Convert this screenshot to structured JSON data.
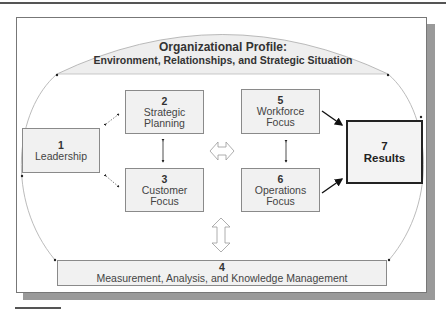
{
  "diagram": {
    "profile": {
      "title": "Organizational Profile:",
      "subtitle": "Environment, Relationships, and Strategic Situation"
    },
    "boxes": [
      {
        "id": "leadership",
        "number": "1",
        "label": "Leadership"
      },
      {
        "id": "strategic-planning",
        "number": "2",
        "label_lines": [
          "Strategic",
          "Planning"
        ]
      },
      {
        "id": "customer-focus",
        "number": "3",
        "label_lines": [
          "Customer",
          "Focus"
        ]
      },
      {
        "id": "measurement",
        "number": "4",
        "label": "Measurement, Analysis, and Knowledge Management"
      },
      {
        "id": "workforce-focus",
        "number": "5",
        "label_lines": [
          "Workforce",
          "Focus"
        ]
      },
      {
        "id": "operations-focus",
        "number": "6",
        "label_lines": [
          "Operations",
          "Focus"
        ]
      },
      {
        "id": "results",
        "number": "7",
        "label": "Results"
      }
    ],
    "colors": {
      "box_fill": "#f1f1f1",
      "profile_fill": "#eeeeee",
      "shadow": "#9a9a9a",
      "border": "#8a8a8a",
      "results_border": "#222222"
    }
  }
}
